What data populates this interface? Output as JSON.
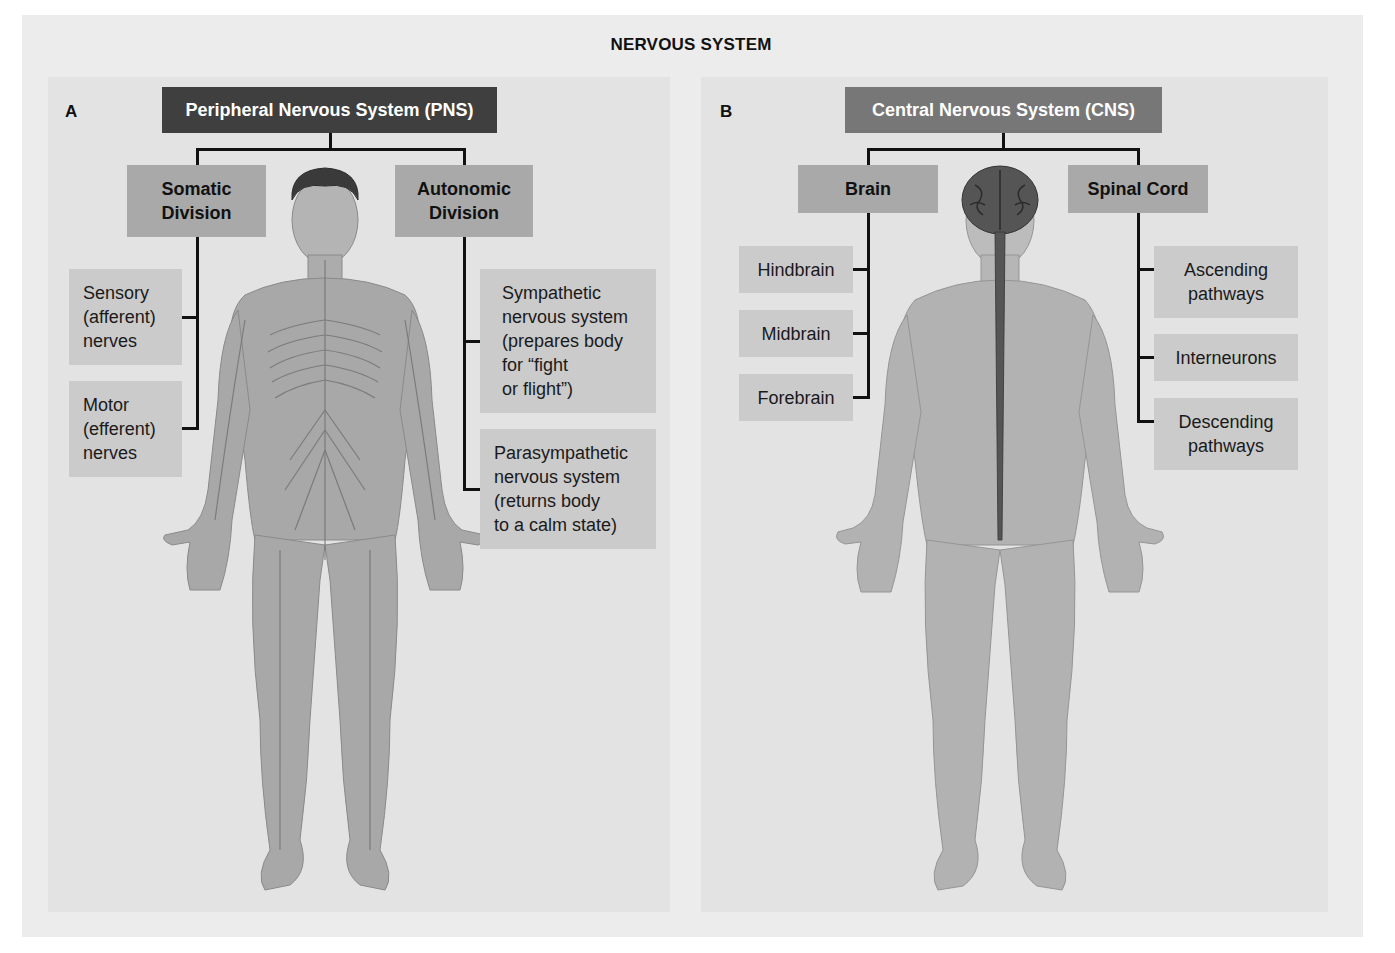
{
  "title": "NERVOUS SYSTEM",
  "panels": {
    "a": {
      "letter": "A",
      "header": "Peripheral Nervous System (PNS)",
      "divisions": [
        {
          "label": "Somatic\nDivision",
          "children": [
            {
              "label": "Sensory\n(afferent)\nnerves"
            },
            {
              "label": "Motor\n(efferent)\nnerves"
            }
          ]
        },
        {
          "label": "Autonomic\nDivision",
          "children": [
            {
              "label": "Sympathetic\nnervous system\n(prepares body\nfor “fight\nor flight”)"
            },
            {
              "label": "Parasympathetic\nnervous system\n(returns body\nto a calm state)"
            }
          ]
        }
      ],
      "figure": "front-body-with-peripheral-nerves"
    },
    "b": {
      "letter": "B",
      "header": "Central Nervous System (CNS)",
      "divisions": [
        {
          "label": "Brain",
          "children": [
            {
              "label": "Hindbrain"
            },
            {
              "label": "Midbrain"
            },
            {
              "label": "Forebrain"
            }
          ]
        },
        {
          "label": "Spinal Cord",
          "children": [
            {
              "label": "Ascending\npathways"
            },
            {
              "label": "Interneurons"
            },
            {
              "label": "Descending\npathways"
            }
          ]
        }
      ],
      "figure": "body-with-brain-and-spinal-cord"
    }
  },
  "colors": {
    "header_dark": "#3f3f3f",
    "header_mid": "#777777",
    "division_box": "#a9a9a9",
    "leaf_box": "#cbcbcb",
    "panel_bg": "#e3e3e3",
    "skin": "#a5a5a5",
    "connector": "#111111"
  }
}
